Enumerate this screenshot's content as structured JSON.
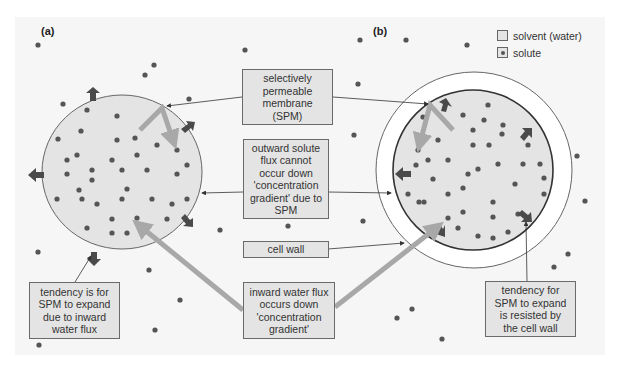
{
  "panels": {
    "a_label": "(a)",
    "b_label": "(b)"
  },
  "legend": {
    "items": [
      {
        "label": "solvent (water)",
        "icon": "solvent-swatch"
      },
      {
        "label": "solute",
        "icon": "solute-dot"
      }
    ]
  },
  "labels": {
    "spm": "selectively\npermeable\nmembrane\n(SPM)",
    "outward": "outward solute\nflux cannot\noccur down\n'concentration\ngradient' due to\nSPM",
    "cell_wall": "cell wall",
    "inward": "inward water flux\noccurs down\n'concentration\ngradient'",
    "tendency_a": "tendency is for\nSPM to expand\ndue to inward\nwater flux",
    "tendency_b": "tendency for\nSPM to expand\nis resisted by\nthe cell wall"
  },
  "colors": {
    "cell_fill": "#e4e4e4",
    "solute_dot": "#555555",
    "expansion_arrow": "#4a4a4a",
    "flux_arrow": "#a8a8a8",
    "box_fill": "#e4e4e4",
    "outline": "#555555"
  }
}
